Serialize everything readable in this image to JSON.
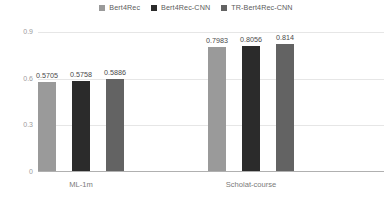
{
  "chart_data": {
    "type": "bar",
    "title": "",
    "xlabel": "",
    "ylabel": "",
    "categories": [
      "ML-1m",
      "Scholat-course"
    ],
    "series": [
      {
        "name": "Bert4Rec",
        "color": "#9a9a9a",
        "values": [
          0.5705,
          0.7983
        ],
        "labels": [
          "0.5705",
          "0.7983"
        ]
      },
      {
        "name": "Bert4Rec-CNN",
        "color": "#2b2b2b",
        "values": [
          0.5758,
          0.8056
        ],
        "labels": [
          "0.5758",
          "0.8056"
        ]
      },
      {
        "name": "TR-Bert4Rec-CNN",
        "color": "#636363",
        "values": [
          0.5886,
          0.814
        ],
        "labels": [
          "0.5886",
          "0.814"
        ]
      }
    ],
    "ylim": [
      0,
      0.9
    ],
    "yticks": [
      0,
      0.3,
      0.6,
      0.9
    ],
    "ytick_labels": [
      "0",
      "0.3",
      "0.6",
      "0.9"
    ],
    "grid": true,
    "legend_position": "top-center"
  }
}
